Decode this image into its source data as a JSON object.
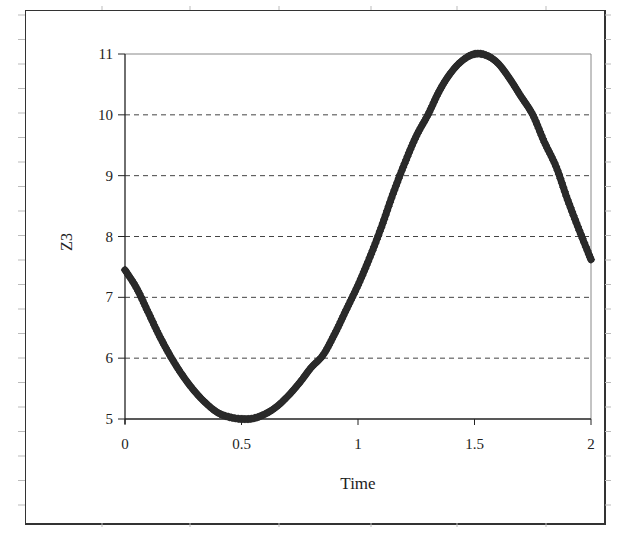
{
  "chart_data": {
    "type": "line",
    "title": "",
    "xlabel": "Time",
    "ylabel": "Z3",
    "xlim": [
      0,
      2
    ],
    "ylim": [
      5,
      11
    ],
    "x_ticks": [
      "0",
      "0.5",
      "1",
      "1.5",
      "2"
    ],
    "y_ticks": [
      "5",
      "6",
      "7",
      "8",
      "9",
      "10",
      "11"
    ],
    "grid": "horizontal dashed",
    "legend": "none",
    "series": [
      {
        "name": "Z3",
        "marker": "diamond",
        "color": "#222222",
        "x": [
          0,
          0.05,
          0.1,
          0.15,
          0.2,
          0.25,
          0.3,
          0.35,
          0.4,
          0.45,
          0.5,
          0.55,
          0.6,
          0.65,
          0.7,
          0.75,
          0.8,
          0.85,
          0.9,
          0.95,
          1.0,
          1.05,
          1.1,
          1.15,
          1.2,
          1.25,
          1.3,
          1.35,
          1.4,
          1.45,
          1.5,
          1.55,
          1.6,
          1.65,
          1.7,
          1.75,
          1.8,
          1.85,
          1.9,
          1.95,
          2.0
        ],
        "values": [
          7.45,
          7.15,
          6.75,
          6.35,
          6.0,
          5.7,
          5.45,
          5.25,
          5.1,
          5.03,
          5.0,
          5.01,
          5.08,
          5.2,
          5.38,
          5.6,
          5.85,
          6.05,
          6.4,
          6.8,
          7.2,
          7.65,
          8.15,
          8.7,
          9.2,
          9.65,
          10.0,
          10.4,
          10.7,
          10.9,
          11.0,
          10.98,
          10.85,
          10.6,
          10.3,
          10.0,
          9.55,
          9.15,
          8.6,
          8.1,
          7.62
        ]
      }
    ]
  }
}
